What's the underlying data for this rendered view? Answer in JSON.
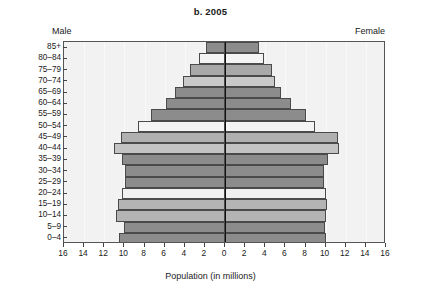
{
  "chart_data": {
    "type": "bar",
    "subtype": "population-pyramid",
    "title": "b. 2005",
    "xlabel": "Population (in millions)",
    "ylabel": "",
    "left_series_label": "Male",
    "right_series_label": "Female",
    "xlim": [
      -16,
      16
    ],
    "xticks": [
      16,
      14,
      12,
      10,
      8,
      6,
      4,
      2,
      0,
      2,
      4,
      6,
      8,
      10,
      12,
      14,
      16
    ],
    "grid": false,
    "legend": "none",
    "categories": [
      "0-4",
      "5-9",
      "10-14",
      "15-19",
      "20-24",
      "25-29",
      "30-34",
      "35-39",
      "40-44",
      "45-49",
      "50-54",
      "55-59",
      "60-64",
      "65-69",
      "70-74",
      "75-79",
      "80-84",
      "85+"
    ],
    "series": [
      {
        "name": "Male",
        "values": [
          10.5,
          10.0,
          10.8,
          10.6,
          10.2,
          9.9,
          9.9,
          10.2,
          11.0,
          10.3,
          8.6,
          7.4,
          5.9,
          5.0,
          4.2,
          3.5,
          2.6,
          1.9
        ]
      },
      {
        "name": "Female",
        "values": [
          10.0,
          9.9,
          10.0,
          10.1,
          10.0,
          9.8,
          9.8,
          10.2,
          11.3,
          11.2,
          8.9,
          8.0,
          6.6,
          5.6,
          5.0,
          4.7,
          3.9,
          3.4
        ]
      }
    ],
    "bar_fills": [
      "#8c8c8c",
      "#8c8c8c",
      "#b4b4b4",
      "#b4b4b4",
      "#f0f0f0",
      "#8c8c8c",
      "#8c8c8c",
      "#8c8c8c",
      "#c3c3c3",
      "#b0b0b0",
      "#f4f4f4",
      "#8c8c8c",
      "#8c8c8c",
      "#8c8c8c",
      "#c9c9c9",
      "#a8a8a8",
      "#f4f4f4",
      "#8c8c8c"
    ],
    "axis_rows_order": "bottom-to-top",
    "colors": {
      "plot_background": "#f2f2f2",
      "bar_dark": "#8c8c8c",
      "bar_mid": "#b4b4b4",
      "bar_light": "#f2f2f2",
      "bar_outline": "#4a4a4a",
      "axis": "#555555",
      "text": "#1a1a1a"
    }
  }
}
